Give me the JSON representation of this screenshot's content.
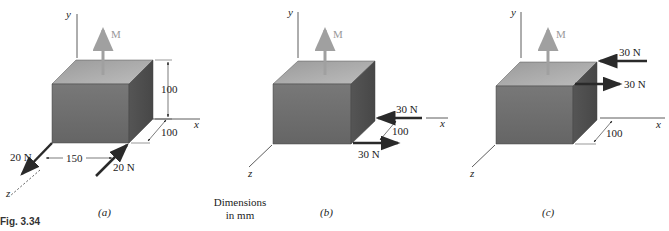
{
  "figure": {
    "caption": "Fig. 3.34",
    "note_line1": "Dimensions",
    "note_line2": "in mm",
    "colors": {
      "front_face": "#6e6e6e",
      "top_face": "#a8a8a8",
      "side_face": "#4e4e4e",
      "moment_arrow": "#a0a0a0",
      "force_arrow": "#2a2a2a"
    }
  },
  "panels": [
    {
      "id": "a",
      "label": "(a)",
      "axes": {
        "x": "x",
        "y": "y",
        "z": "z"
      },
      "moment_label": "M",
      "forces": [
        {
          "label": "20 N",
          "position": "front-left bottom edge",
          "direction": "+z"
        },
        {
          "label": "20 N",
          "position": "front-right bottom edge",
          "direction": "-z"
        }
      ],
      "dimensions": {
        "height": "100",
        "depth": "100",
        "width": "150"
      }
    },
    {
      "id": "b",
      "label": "(b)",
      "axes": {
        "x": "x",
        "y": "y",
        "z": "z"
      },
      "moment_label": "M",
      "forces": [
        {
          "label": "30 N",
          "position": "back-right bottom edge",
          "direction": "-x"
        },
        {
          "label": "30 N",
          "position": "front-right bottom edge",
          "direction": "+x"
        }
      ],
      "dimensions": {
        "depth": "100"
      }
    },
    {
      "id": "c",
      "label": "(c)",
      "axes": {
        "x": "x",
        "y": "y",
        "z": "z"
      },
      "moment_label": "M",
      "forces": [
        {
          "label": "30 N",
          "position": "back-right top edge",
          "direction": "-x"
        },
        {
          "label": "30 N",
          "position": "front-right top edge",
          "direction": "+x"
        }
      ],
      "dimensions": {
        "depth": "100"
      }
    }
  ]
}
